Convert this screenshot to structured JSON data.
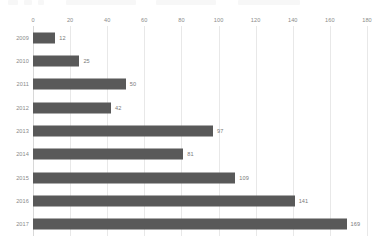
{
  "chart_data": {
    "type": "bar",
    "orientation": "horizontal",
    "title": "",
    "xlabel": "",
    "ylabel": "",
    "categories": [
      "2009",
      "2010",
      "2011",
      "2012",
      "2013",
      "2014",
      "2015",
      "2016",
      "2017"
    ],
    "values": [
      12,
      25,
      50,
      42,
      97,
      81,
      109,
      141,
      169
    ],
    "value_labels": [
      "12",
      "25",
      "50",
      "42",
      "97",
      "81",
      "109",
      "141",
      "169"
    ],
    "xlim": [
      0,
      180
    ],
    "xticks": [
      0,
      20,
      40,
      60,
      80,
      100,
      120,
      140,
      160,
      180
    ],
    "xtick_labels": [
      "0",
      "20",
      "40",
      "60",
      "80",
      "100",
      "120",
      "140",
      "160",
      "180"
    ],
    "grid": true,
    "grid_axis": "x",
    "legend": false,
    "legend_position": "none",
    "data_labels": true,
    "colors": {
      "bar": "#595959",
      "gridline": "#e8e8e8",
      "axis_line": "#d8d8d8",
      "tick_text": "#8a8a8a",
      "value_text": "#7a7a7a",
      "background": "#ffffff"
    }
  }
}
